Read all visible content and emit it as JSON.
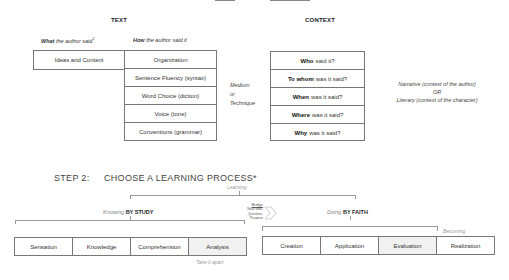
{
  "step1": {
    "text_section": {
      "header": "TEXT",
      "what_label_bold": "What",
      "what_label_rest": "the author said",
      "what_footnote": "1",
      "how_label_bold": "How",
      "how_label_rest": "the author said it",
      "what_box": "Ideas and Content",
      "how_items": [
        "Organization",
        "Sentence Fluency (syntax)",
        "Word Choice (diction)",
        "Voice (tone)",
        "Conventions (grammar)"
      ],
      "side_note": [
        "Medium",
        "or",
        "Technique"
      ]
    },
    "context_section": {
      "header": "CONTEXT",
      "items": [
        {
          "bold": "Who",
          "rest": "said it?"
        },
        {
          "bold": "To whom",
          "rest": "was it said?"
        },
        {
          "bold": "When",
          "rest": "was it said?"
        },
        {
          "bold": "Where",
          "rest": "was it said?"
        },
        {
          "bold": "Why",
          "rest": "was it said?"
        }
      ],
      "side_note": [
        "Narrative (context of the author)",
        "OR",
        "Literary (context of the character)"
      ]
    }
  },
  "step2": {
    "step_label": "STEP 2:",
    "title": "CHOOSE A LEARNING PROCESS*",
    "top_label": "Learning",
    "left_group": {
      "faint": "Knowing",
      "bold": "BY STUDY",
      "items": [
        "Sensation",
        "Knowledge",
        "Comprehension",
        "Analysis"
      ],
      "under_note": "Take it apart"
    },
    "bridge": {
      "title": "Bridge",
      "lines": [
        "New Idea,",
        "Question,",
        "Purpose"
      ]
    },
    "right_group": {
      "faint": "Doing",
      "bold": "BY FAITH",
      "items": [
        "Creation",
        "Application",
        "Evaluation",
        "Realization"
      ],
      "side_label": "Becoming"
    }
  }
}
